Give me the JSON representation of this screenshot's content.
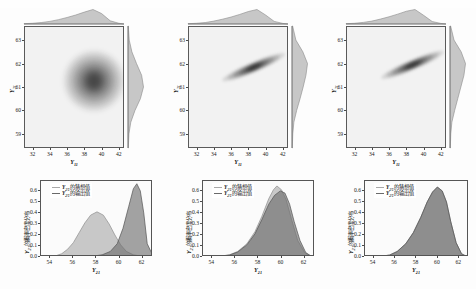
{
  "figure": {
    "background": "#ffffff",
    "panel_face": "#f2f2f2",
    "accent_light": "#b9b9b9",
    "accent_dark": "#6f6f6f"
  },
  "variables": {
    "x_var": "Y",
    "x_sub": "11",
    "y_var": "Y",
    "y_sub": "21"
  },
  "legend": {
    "guess_label": "的猜想值",
    "output_label": "的输出值",
    "guess_color": "#a8a8a8",
    "output_color": "#6a6a6a"
  },
  "density_axis_label": "的概率密度分布",
  "chart_data": [
    {
      "id": "joint-left",
      "type": "heatmap",
      "title": "",
      "xlabel": "Y11",
      "ylabel": "Y21",
      "xlim": [
        31,
        42.6
      ],
      "ylim": [
        58.4,
        63.6
      ],
      "xticks": [
        32,
        34,
        36,
        38,
        40,
        42
      ],
      "yticks": [
        59,
        60,
        61,
        62,
        63
      ],
      "grid": false,
      "mode_x": 39.0,
      "mode_y": 61.3,
      "shape": "broad rounded contour cluster, slight negative skew in x",
      "correlation": 0.15,
      "contour_levels": [
        0.1,
        0.3,
        0.5,
        0.7,
        0.9
      ],
      "marginal_top": {
        "type": "area",
        "x": [
          31,
          32,
          33,
          34,
          35,
          36,
          37,
          38,
          39,
          40,
          41,
          42
        ],
        "values": [
          0.02,
          0.05,
          0.1,
          0.18,
          0.3,
          0.45,
          0.62,
          0.82,
          1.0,
          0.72,
          0.22,
          0.05
        ]
      },
      "marginal_right": {
        "type": "area",
        "x": [
          58.4,
          59,
          59.5,
          60,
          60.5,
          61,
          61.5,
          62,
          62.5,
          63,
          63.6
        ],
        "values": [
          0.02,
          0.06,
          0.18,
          0.45,
          0.8,
          1.0,
          0.88,
          0.55,
          0.25,
          0.08,
          0.02
        ]
      }
    },
    {
      "id": "joint-middle",
      "type": "heatmap",
      "title": "",
      "xlabel": "Y11",
      "ylabel": "Y21",
      "xlim": [
        31,
        42.6
      ],
      "ylim": [
        58.4,
        63.6
      ],
      "xticks": [
        32,
        34,
        36,
        38,
        40,
        42
      ],
      "yticks": [
        59,
        60,
        61,
        62,
        63
      ],
      "grid": false,
      "mode_x": 39.2,
      "mode_y": 62.1,
      "shape": "narrow elongated diagonal ridge from (34,60.2) to (40,62.5)",
      "correlation": 0.94,
      "contour_levels": [
        0.1,
        0.3,
        0.5,
        0.7,
        0.9
      ],
      "marginal_top": {
        "type": "area",
        "x": [
          31,
          32,
          33,
          34,
          35,
          36,
          37,
          38,
          39,
          40,
          41,
          42
        ],
        "values": [
          0.02,
          0.05,
          0.1,
          0.2,
          0.33,
          0.48,
          0.66,
          0.86,
          1.0,
          0.62,
          0.18,
          0.04
        ]
      },
      "marginal_right": {
        "type": "area",
        "x": [
          58.4,
          59,
          59.5,
          60,
          60.5,
          61,
          61.5,
          62,
          62.5,
          63,
          63.6
        ],
        "values": [
          0.02,
          0.05,
          0.12,
          0.3,
          0.52,
          0.72,
          0.9,
          1.0,
          0.7,
          0.25,
          0.04
        ]
      }
    },
    {
      "id": "joint-right",
      "type": "heatmap",
      "title": "",
      "xlabel": "Y11",
      "ylabel": "Y21",
      "xlim": [
        31,
        42.6
      ],
      "ylim": [
        58.4,
        63.6
      ],
      "xticks": [
        32,
        34,
        36,
        38,
        40,
        42
      ],
      "yticks": [
        59,
        60,
        61,
        62,
        63
      ],
      "grid": false,
      "mode_x": 39.3,
      "mode_y": 62.2,
      "shape": "narrow elongated diagonal ridge from (34,60.2) to (40.5,62.7)",
      "correlation": 0.95,
      "contour_levels": [
        0.1,
        0.3,
        0.5,
        0.7,
        0.9
      ],
      "marginal_top": {
        "type": "area",
        "x": [
          31,
          32,
          33,
          34,
          35,
          36,
          37,
          38,
          39,
          40,
          41,
          42
        ],
        "values": [
          0.02,
          0.05,
          0.11,
          0.2,
          0.34,
          0.5,
          0.68,
          0.88,
          1.0,
          0.6,
          0.17,
          0.04
        ]
      },
      "marginal_right": {
        "type": "area",
        "x": [
          58.4,
          59,
          59.5,
          60,
          60.5,
          61,
          61.5,
          62,
          62.5,
          63,
          63.6
        ],
        "values": [
          0.02,
          0.05,
          0.12,
          0.3,
          0.5,
          0.7,
          0.9,
          1.0,
          0.72,
          0.26,
          0.04
        ]
      }
    },
    {
      "id": "density-left",
      "type": "area",
      "title": "",
      "xlabel": "Y21",
      "ylabel": "Y21 的概率密度分布",
      "xlim": [
        53.2,
        62.9
      ],
      "ylim": [
        0,
        0.69
      ],
      "xticks": [
        54,
        56,
        58,
        60,
        62
      ],
      "yticks": [
        0.0,
        0.1,
        0.2,
        0.3,
        0.4,
        0.5,
        0.6
      ],
      "grid": false,
      "series": [
        {
          "name": "guess",
          "peak_x": 58.05,
          "peak_y": 0.41,
          "x": [
            53.2,
            54,
            54.5,
            55,
            55.5,
            56,
            56.5,
            57,
            57.5,
            58.05,
            58.6,
            59.1,
            59.6,
            60.1,
            60.6,
            61.2,
            62,
            62.9
          ],
          "values": [
            0.0,
            0.005,
            0.012,
            0.03,
            0.07,
            0.13,
            0.22,
            0.31,
            0.38,
            0.41,
            0.38,
            0.3,
            0.2,
            0.11,
            0.05,
            0.02,
            0.005,
            0.0
          ]
        },
        {
          "name": "output",
          "peak_x": 61.5,
          "peak_y": 0.665,
          "x": [
            53.2,
            56,
            57.5,
            58.5,
            59.2,
            59.8,
            60.3,
            60.8,
            61.2,
            61.5,
            61.8,
            62.1,
            62.4,
            62.9
          ],
          "values": [
            0.0,
            0.0,
            0.005,
            0.02,
            0.05,
            0.12,
            0.26,
            0.46,
            0.62,
            0.665,
            0.6,
            0.4,
            0.12,
            0.01
          ]
        }
      ]
    },
    {
      "id": "density-middle",
      "type": "area",
      "title": "",
      "xlabel": "Y21",
      "ylabel": "Y21 的概率密度分布",
      "xlim": [
        53.2,
        62.9
      ],
      "ylim": [
        0,
        0.69
      ],
      "xticks": [
        54,
        56,
        58,
        60,
        62
      ],
      "yticks": [
        0.0,
        0.1,
        0.2,
        0.3,
        0.4,
        0.5,
        0.6
      ],
      "grid": false,
      "series": [
        {
          "name": "guess",
          "peak_x": 59.6,
          "peak_y": 0.645,
          "x": [
            53.2,
            54.5,
            55.5,
            56.2,
            57,
            57.7,
            58.3,
            58.9,
            59.3,
            59.6,
            60.0,
            60.4,
            60.9,
            61.4,
            62,
            62.6,
            62.9
          ],
          "values": [
            0.0,
            0.005,
            0.02,
            0.05,
            0.12,
            0.23,
            0.37,
            0.53,
            0.61,
            0.645,
            0.61,
            0.52,
            0.33,
            0.15,
            0.04,
            0.005,
            0.0
          ]
        },
        {
          "name": "output",
          "peak_x": 59.9,
          "peak_y": 0.6,
          "x": [
            53.2,
            54.5,
            55.5,
            56.2,
            57,
            57.7,
            58.3,
            58.9,
            59.4,
            59.9,
            60.3,
            60.7,
            61.1,
            61.6,
            62.1,
            62.6,
            62.9
          ],
          "values": [
            0.0,
            0.004,
            0.018,
            0.045,
            0.11,
            0.21,
            0.34,
            0.48,
            0.56,
            0.6,
            0.58,
            0.48,
            0.32,
            0.15,
            0.04,
            0.006,
            0.0
          ]
        }
      ]
    },
    {
      "id": "density-right",
      "type": "area",
      "title": "",
      "xlabel": "Y21",
      "ylabel": "Y21 的概率密度分布",
      "xlim": [
        53.2,
        62.9
      ],
      "ylim": [
        0,
        0.69
      ],
      "xticks": [
        54,
        56,
        58,
        60,
        62
      ],
      "yticks": [
        0.0,
        0.1,
        0.2,
        0.3,
        0.4,
        0.5,
        0.6
      ],
      "grid": false,
      "series": [
        {
          "name": "guess",
          "peak_x": 59.95,
          "peak_y": 0.635,
          "x": [
            53.2,
            54.5,
            55.5,
            56.2,
            57,
            57.7,
            58.4,
            59.0,
            59.5,
            59.95,
            60.4,
            60.8,
            61.2,
            61.7,
            62.2,
            62.7,
            62.9
          ],
          "values": [
            0.0,
            0.004,
            0.018,
            0.05,
            0.12,
            0.22,
            0.36,
            0.5,
            0.59,
            0.635,
            0.6,
            0.5,
            0.32,
            0.13,
            0.03,
            0.004,
            0.0
          ]
        },
        {
          "name": "output",
          "peak_x": 59.95,
          "peak_y": 0.635,
          "x": [
            53.2,
            54.5,
            55.5,
            56.2,
            57,
            57.7,
            58.4,
            59.0,
            59.5,
            59.95,
            60.4,
            60.8,
            61.2,
            61.7,
            62.2,
            62.7,
            62.9
          ],
          "values": [
            0.0,
            0.004,
            0.018,
            0.05,
            0.12,
            0.22,
            0.36,
            0.5,
            0.59,
            0.635,
            0.6,
            0.5,
            0.32,
            0.13,
            0.03,
            0.004,
            0.0
          ]
        }
      ]
    }
  ]
}
